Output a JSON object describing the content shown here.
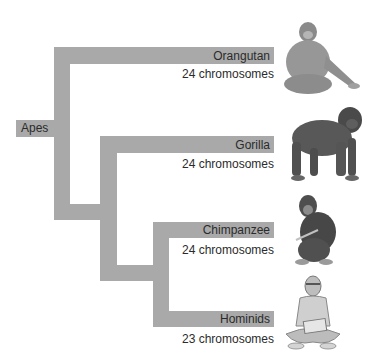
{
  "diagram": {
    "root": {
      "label": "Apes"
    },
    "colors": {
      "bar": "#a9a9a9",
      "text": "#2b2b2b"
    },
    "taxa": [
      {
        "name": "Orangutan",
        "chromosomes": "24 chromosomes",
        "icon": "orangutan-illustration"
      },
      {
        "name": "Gorilla",
        "chromosomes": "24 chromosomes",
        "icon": "gorilla-illustration"
      },
      {
        "name": "Chimpanzee",
        "chromosomes": "24 chromosomes",
        "icon": "chimpanzee-illustration"
      },
      {
        "name": "Hominids",
        "chromosomes": "23 chromosomes",
        "icon": "human-illustration"
      }
    ]
  }
}
